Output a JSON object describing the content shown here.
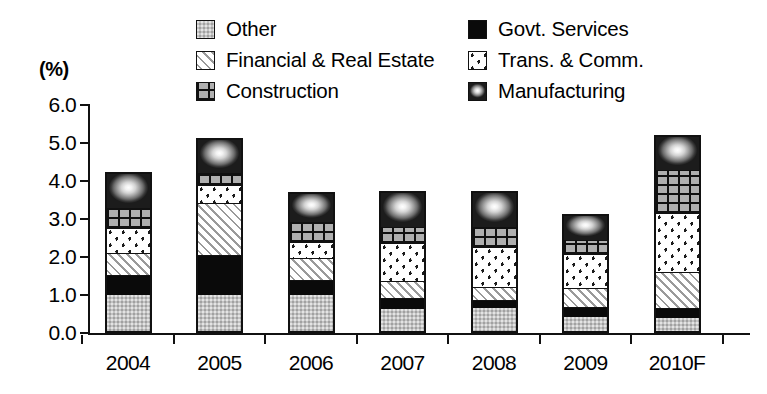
{
  "chart_data": {
    "type": "bar",
    "stacked": true,
    "title": "",
    "subtitle": "",
    "xlabel": "",
    "ylabel": "(%)",
    "unit": "%",
    "grid": false,
    "legend_position": "top",
    "ylim": [
      0.0,
      6.0
    ],
    "ytick_step": 1.0,
    "ytick_labels": [
      "0.0",
      "1.0",
      "2.0",
      "3.0",
      "4.0",
      "5.0",
      "6.0"
    ],
    "ytick_values": [
      0.0,
      1.0,
      2.0,
      3.0,
      4.0,
      5.0,
      6.0
    ],
    "categories": [
      "2004",
      "2005",
      "2006",
      "2007",
      "2008",
      "2009",
      "2010F"
    ],
    "series": [
      {
        "name": "Other",
        "pattern": "light-gray-dotted",
        "values": [
          0.95,
          0.95,
          0.95,
          0.58,
          0.6,
          0.38,
          0.35
        ]
      },
      {
        "name": "Govt. Services",
        "pattern": "solid-black",
        "values": [
          0.52,
          1.05,
          0.39,
          0.28,
          0.22,
          0.26,
          0.25
        ]
      },
      {
        "name": "Financial & Real Estate",
        "pattern": "diagonal-hatch",
        "values": [
          0.58,
          1.36,
          0.57,
          0.46,
          0.35,
          0.48,
          0.96
        ]
      },
      {
        "name": "Trans. & Comm.",
        "pattern": "white-with-dots",
        "values": [
          0.65,
          0.48,
          0.44,
          0.99,
          1.05,
          0.92,
          1.54
        ]
      },
      {
        "name": "Construction",
        "pattern": "gray-grid",
        "values": [
          0.55,
          0.31,
          0.53,
          0.44,
          0.53,
          0.35,
          1.14
        ]
      },
      {
        "name": "Manufacturing",
        "pattern": "radial-gradient-gray",
        "values": [
          1.0,
          0.99,
          0.82,
          0.98,
          0.98,
          0.75,
          0.96
        ]
      }
    ],
    "totals": [
      4.25,
      5.14,
      3.7,
      3.73,
      3.73,
      3.14,
      5.2
    ]
  },
  "legend": {
    "items": [
      {
        "label": "Other",
        "swatch": "other-swatch",
        "column": "left"
      },
      {
        "label": "Govt. Services",
        "swatch": "govt-swatch",
        "column": "right"
      },
      {
        "label": "Financial & Real Estate",
        "swatch": "financial-swatch",
        "column": "left"
      },
      {
        "label": "Trans. & Comm.",
        "swatch": "trans-swatch",
        "column": "right"
      },
      {
        "label": "Construction",
        "swatch": "construction-swatch",
        "column": "left"
      },
      {
        "label": "Manufacturing",
        "swatch": "manufacturing-swatch",
        "column": "right"
      }
    ]
  },
  "colors": {
    "axis": "#111111",
    "other": "#c3c3c3",
    "govt_services": "#0a0a0a",
    "financial_real_estate": "#b9b9b9",
    "trans_comm": "#ffffff",
    "construction": "#b0b0b0",
    "manufacturing": "#808080",
    "background": "#ffffff"
  }
}
